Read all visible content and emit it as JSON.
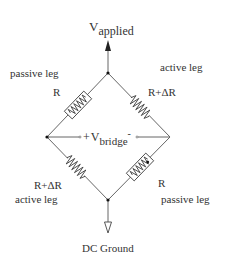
{
  "diagram": {
    "labels": {
      "v_applied_main": "V",
      "v_applied_sub": "applied",
      "v_bridge_plus": "+",
      "v_bridge_main": "V",
      "v_bridge_sub": "bridge",
      "v_bridge_minus": "-",
      "dc_ground": "DC Ground"
    },
    "legs": [
      {
        "id": "top-left",
        "role": "passive leg",
        "value": "R"
      },
      {
        "id": "top-right",
        "role": "active leg",
        "value": "R+ΔR"
      },
      {
        "id": "bottom-left",
        "role": "active leg",
        "value": "R+ΔR"
      },
      {
        "id": "bottom-right",
        "role": "passive leg",
        "value": "R"
      }
    ],
    "colors": {
      "line": "#666666",
      "text": "#333333",
      "background": "#ffffff"
    }
  }
}
